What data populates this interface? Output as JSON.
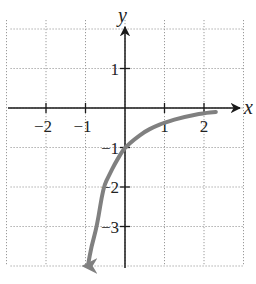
{
  "chart_data": {
    "type": "line",
    "title": "",
    "xlabel": "x",
    "ylabel": "y",
    "xlim": [
      -3,
      3
    ],
    "ylim": [
      -4,
      2
    ],
    "grid": true,
    "grid_style": "dotted",
    "x_ticks": [
      -2,
      -1,
      1,
      2
    ],
    "y_ticks": [
      1,
      -1,
      -2,
      -3
    ],
    "x_tick_labels": [
      "−2",
      "−1",
      "1",
      "2"
    ],
    "y_tick_labels": [
      "1",
      "−1",
      "−2",
      "−3"
    ],
    "series": [
      {
        "name": "curve",
        "color": "#808080",
        "arrow_at_start": true,
        "x": [
          -0.94,
          -0.85,
          -0.71,
          -0.55,
          -0.4,
          -0.25,
          -0.1,
          0,
          0.25,
          0.5,
          0.75,
          1,
          1.5,
          2,
          2.3
        ],
        "y": [
          -4.0,
          -3.5,
          -3.0,
          -2.0,
          -1.7,
          -1.4,
          -1.15,
          -1.0,
          -0.78,
          -0.6,
          -0.47,
          -0.37,
          -0.22,
          -0.13,
          -0.1
        ]
      }
    ]
  },
  "labels": {
    "x_axis": "x",
    "y_axis": "y"
  },
  "colors": {
    "curve": "#808080",
    "axis": "#1a1a1a",
    "grid": "#9a9a9a"
  }
}
